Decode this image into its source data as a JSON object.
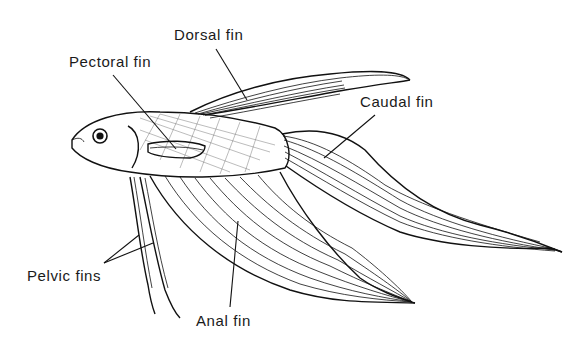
{
  "diagram": {
    "labels": {
      "dorsal": "Dorsal fin",
      "pectoral": "Pectoral fin",
      "caudal": "Caudal fin",
      "pelvic": "Pelvic fins",
      "anal": "Anal fin"
    },
    "colors": {
      "ink": "#111111",
      "background": "#ffffff"
    }
  }
}
